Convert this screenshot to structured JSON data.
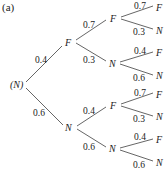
{
  "figure_label": "(a)",
  "root": {
    "label": "(N)"
  },
  "level1": [
    {
      "label": "F",
      "prob": "0.4"
    },
    {
      "label": "N",
      "prob": "0.6"
    }
  ],
  "level2": [
    {
      "label": "F",
      "prob": "0.7"
    },
    {
      "label": "N",
      "prob": "0.3"
    },
    {
      "label": "F",
      "prob": "0.4"
    },
    {
      "label": "N",
      "prob": "0.6"
    }
  ],
  "level3": [
    {
      "label": "F",
      "prob": "0.7"
    },
    {
      "label": "N",
      "prob": "0.3"
    },
    {
      "label": "F",
      "prob": "0.4"
    },
    {
      "label": "N",
      "prob": "0.6"
    },
    {
      "label": "F",
      "prob": "0.7"
    },
    {
      "label": "N",
      "prob": "0.3"
    },
    {
      "label": "F",
      "prob": "0.4"
    },
    {
      "label": "N",
      "prob": "0.6"
    }
  ]
}
